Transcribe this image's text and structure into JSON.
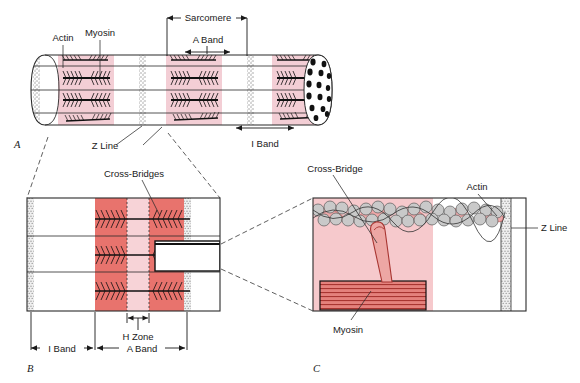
{
  "figure": {
    "panels": [
      {
        "id": "A",
        "label": "A",
        "caption": "Myofibril cylinder showing repeating sarcomeres"
      },
      {
        "id": "B",
        "label": "B",
        "caption": "Enlarged sarcomere with thick and thin filaments"
      },
      {
        "id": "C",
        "label": "C",
        "caption": "Molecular detail of actin, myosin and cross-bridge"
      }
    ]
  },
  "panelA": {
    "label": "A",
    "labels": {
      "actin": "Actin",
      "myosin": "Myosin",
      "z_line": "Z Line"
    },
    "dimensions": [
      {
        "name": "sarcomere",
        "label": "Sarcomere"
      },
      {
        "name": "a-band",
        "label": "A Band"
      },
      {
        "name": "i-band",
        "label": "I Band"
      }
    ]
  },
  "panelB": {
    "label": "B",
    "labels": {
      "cross_bridges": "Cross-Bridges"
    },
    "dimensions": [
      {
        "name": "h-zone",
        "label": "H Zone"
      },
      {
        "name": "i-band",
        "label": "I Band"
      },
      {
        "name": "a-band",
        "label": "A Band"
      }
    ]
  },
  "panelC": {
    "label": "C",
    "labels": {
      "cross_bridge": "Cross-Bridge",
      "actin": "Actin",
      "myosin": "Myosin",
      "z_line": "Z Line"
    }
  },
  "colors": {
    "light_pink": "#f3ced5",
    "mid_pink": "#f6c9cc",
    "dark_band": "#e8736d",
    "pale_band": "#f7d3d7",
    "myosin_red": "#c4403c",
    "actin_grey": "#c8c8c8",
    "z_line_grey": "#b5b5b5",
    "outline": "#2a2a2a",
    "background": "#ffffff"
  }
}
